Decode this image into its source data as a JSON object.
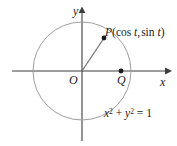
{
  "figure": {
    "background_color": "#ffffff",
    "axis_color": "#3d3d3d",
    "circle_color": "#9a9a9a",
    "radius_color": "#6e6e6e",
    "point_color": "#1a1a1a",
    "text_color": "#1a1a1a"
  },
  "axes": {
    "x_label": "x",
    "y_label": "y",
    "origin_label": "O",
    "x_axis": {
      "start_x": 12,
      "end_x": 168,
      "y": 71
    },
    "y_axis": {
      "x": 82,
      "start_y": 140,
      "end_y": 9
    }
  },
  "circle": {
    "center_x": 82,
    "center_y": 71,
    "radius": 49,
    "equation_parts": {
      "x_var": "x",
      "y_var": "y",
      "exponent": "2",
      "plus": "+",
      "equals": "=",
      "value": "1"
    },
    "equation_text": "x² + y² = 1"
  },
  "points": [
    {
      "id": "P",
      "label": "P",
      "coordinates_text": "(cos t, sin t)",
      "cos_part": "cos",
      "sin_part": "sin",
      "parameter": "t",
      "px": 104,
      "py": 38
    },
    {
      "id": "Q",
      "label": "Q",
      "coordinates_text": "",
      "px": 121,
      "py": 71
    }
  ],
  "segments": [
    {
      "id": "radius-OP",
      "from": "O",
      "to": "P"
    }
  ]
}
